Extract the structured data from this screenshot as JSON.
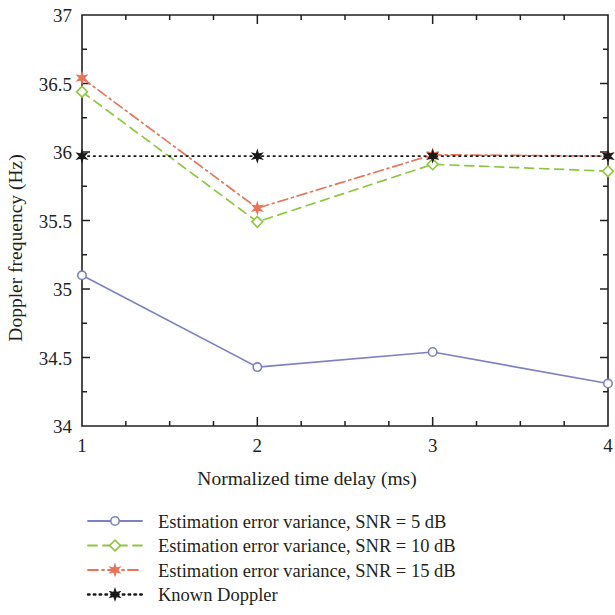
{
  "chart_data": {
    "type": "line",
    "title": "",
    "xlabel": "Normalized time delay (ms)",
    "ylabel": "Doppler frequency (Hz)",
    "x": [
      1,
      2,
      3,
      4
    ],
    "xlim": [
      1,
      4
    ],
    "ylim": [
      34,
      37
    ],
    "xticks": [
      "1",
      "2",
      "3",
      "4"
    ],
    "yticks": [
      "34",
      "34.5",
      "35",
      "35.5",
      "36",
      "36.5",
      "37"
    ],
    "ytick_values": [
      34,
      34.5,
      35,
      35.5,
      36,
      36.5,
      37
    ],
    "xtick_values": [
      1,
      2,
      3,
      4
    ],
    "x_minor_ticks": [
      1.25,
      1.5,
      1.75,
      2.25,
      2.5,
      2.75,
      3.25,
      3.5,
      3.75
    ],
    "grid": false,
    "legend_position": "below",
    "series": [
      {
        "name": "Estimation error variance, SNR = 5 dB",
        "values": [
          35.1,
          34.43,
          34.54,
          34.31
        ],
        "color": "#7d80c4",
        "linestyle": "solid",
        "marker": "circle-open"
      },
      {
        "name": "Estimation error variance, SNR = 10 dB",
        "values": [
          36.44,
          35.49,
          35.91,
          35.86
        ],
        "color": "#8dc63f",
        "linestyle": "dashed",
        "marker": "diamond-open"
      },
      {
        "name": "Estimation error variance, SNR = 15 dB",
        "values": [
          36.54,
          35.59,
          35.98,
          35.97
        ],
        "color": "#e8745a",
        "linestyle": "dashdot",
        "marker": "star-solid"
      },
      {
        "name": "Known Doppler",
        "values": [
          35.97,
          35.97,
          35.97,
          35.97
        ],
        "color": "#1a1a1a",
        "linestyle": "dotted",
        "marker": "star-solid"
      }
    ]
  },
  "axes": {
    "x_title": "Normalized time delay (ms)",
    "y_title": "Doppler frequency (Hz)",
    "y_tick_labels": [
      "37",
      "36.5",
      "36",
      "35.5",
      "35",
      "34.5",
      "34"
    ],
    "x_tick_labels": [
      "1",
      "2",
      "3",
      "4"
    ]
  },
  "legend": {
    "entries": [
      {
        "label": "Estimation error variance, SNR = 5 dB",
        "color": "#7d80c4",
        "style": "solid",
        "marker": "circle-open"
      },
      {
        "label": "Estimation error variance, SNR = 10 dB",
        "color": "#8dc63f",
        "style": "dashed",
        "marker": "diamond-open"
      },
      {
        "label": "Estimation error variance, SNR = 15 dB",
        "color": "#e8745a",
        "style": "dashdot",
        "marker": "star-solid"
      },
      {
        "label": "Known Doppler",
        "color": "#1a1a1a",
        "style": "dotted",
        "marker": "star-solid"
      }
    ]
  },
  "colors": {
    "snr5": "#7d80c4",
    "snr10": "#8dc63f",
    "snr15": "#e8745a",
    "known": "#1a1a1a",
    "axis": "#231f20",
    "background": "#ffffff"
  }
}
